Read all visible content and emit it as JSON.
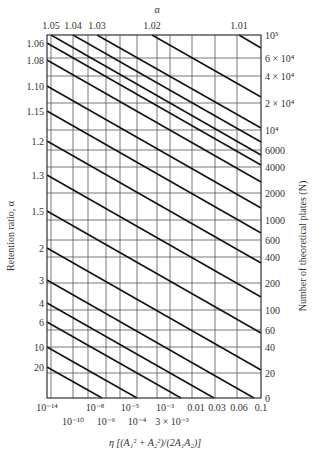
{
  "chart_data": {
    "type": "line",
    "title": "",
    "xlabel": "η [(A₁² + A₂²)/(2A₁A₂)]",
    "ylabel_left": "Retention ratio, α",
    "ylabel_right": "Number of theoretical plates (N)",
    "top_axis_label": "α",
    "top_ticks": [
      {
        "label": "1.05",
        "x": 51
      },
      {
        "label": "1.04",
        "x": 73
      },
      {
        "label": "1.03",
        "x": 97
      },
      {
        "label": "1.02",
        "x": 152
      },
      {
        "label": "1.01",
        "x": 239
      }
    ],
    "left_ticks": [
      {
        "label": "1.06",
        "y": 43
      },
      {
        "label": "1.08",
        "y": 60
      },
      {
        "label": "1.10",
        "y": 86
      },
      {
        "label": "1.15",
        "y": 111
      },
      {
        "label": "1.2",
        "y": 141
      },
      {
        "label": "1.3",
        "y": 175
      },
      {
        "label": "1.5",
        "y": 211
      },
      {
        "label": "2",
        "y": 248
      },
      {
        "label": "3",
        "y": 280
      },
      {
        "label": "4",
        "y": 303
      },
      {
        "label": "6",
        "y": 322
      },
      {
        "label": "10",
        "y": 347
      },
      {
        "label": "20",
        "y": 367
      }
    ],
    "right_ticks": [
      {
        "label": "10⁵",
        "y": 35
      },
      {
        "label": "6 × 10⁴",
        "y": 58
      },
      {
        "label": "4 × 10⁴",
        "y": 76
      },
      {
        "label": "2 × 10⁴",
        "y": 103
      },
      {
        "label": "10⁴",
        "y": 130
      },
      {
        "label": "6000",
        "y": 150
      },
      {
        "label": "4000",
        "y": 167
      },
      {
        "label": "2000",
        "y": 193
      },
      {
        "label": "1000",
        "y": 220
      },
      {
        "label": "600",
        "y": 240
      },
      {
        "label": "400",
        "y": 257
      },
      {
        "label": "200",
        "y": 283
      },
      {
        "label": "100",
        "y": 310
      },
      {
        "label": "60",
        "y": 330
      },
      {
        "label": "40",
        "y": 347
      },
      {
        "label": "20",
        "y": 373
      },
      {
        "label": "0",
        "y": 398
      }
    ],
    "bottom_ticks_row1": [
      {
        "label": "10⁻¹⁴",
        "x": 47
      },
      {
        "label": "10⁻⁸",
        "x": 95
      },
      {
        "label": "10⁻⁵",
        "x": 130
      },
      {
        "label": "10⁻³",
        "x": 165
      },
      {
        "label": "0.01",
        "x": 196
      },
      {
        "label": "0.03",
        "x": 217
      },
      {
        "label": "0.06",
        "x": 239
      },
      {
        "label": "0.1",
        "x": 261
      }
    ],
    "bottom_ticks_row2": [
      {
        "label": "10⁻¹⁰",
        "x": 73
      },
      {
        "label": "10⁻⁶",
        "x": 106
      },
      {
        "label": "10⁻⁴",
        "x": 137
      },
      {
        "label": "3 × 10⁻³",
        "x": 172
      }
    ],
    "plot_area": {
      "x0": 47,
      "y0": 35,
      "x1": 261,
      "y1": 398
    },
    "vertical_gridlines_x": [
      51,
      73,
      88,
      106,
      120,
      137,
      157,
      170,
      192,
      215,
      237
    ],
    "horizontal_gridlines_y": [
      58,
      76,
      103,
      130,
      150,
      167,
      193,
      220,
      240,
      257,
      283,
      310,
      330,
      347,
      373
    ],
    "series": [
      {
        "name": "alpha 1.06 line",
        "x0": 47,
        "y0": 43,
        "x1": 261,
        "y1": 165
      },
      {
        "name": "alpha 1.08 line",
        "x0": 47,
        "y0": 60,
        "x1": 261,
        "y1": 182
      },
      {
        "name": "alpha 1.10 line",
        "x0": 47,
        "y0": 86,
        "x1": 261,
        "y1": 208
      },
      {
        "name": "alpha 1.15 line",
        "x0": 47,
        "y0": 111,
        "x1": 261,
        "y1": 233
      },
      {
        "name": "alpha 1.2 line",
        "x0": 47,
        "y0": 141,
        "x1": 261,
        "y1": 263
      },
      {
        "name": "alpha 1.3 line",
        "x0": 47,
        "y0": 175,
        "x1": 261,
        "y1": 297
      },
      {
        "name": "alpha 1.5 line",
        "x0": 47,
        "y0": 211,
        "x1": 261,
        "y1": 333
      },
      {
        "name": "alpha 2 line",
        "x0": 47,
        "y0": 248,
        "x1": 261,
        "y1": 370
      },
      {
        "name": "alpha 3 line",
        "x0": 47,
        "y0": 280,
        "x1": 254,
        "y1": 398
      },
      {
        "name": "alpha 4 line",
        "x0": 47,
        "y0": 303,
        "x1": 214,
        "y1": 398
      },
      {
        "name": "alpha 6 line",
        "x0": 47,
        "y0": 322,
        "x1": 181,
        "y1": 398
      },
      {
        "name": "alpha 10 line",
        "x0": 47,
        "y0": 347,
        "x1": 137,
        "y1": 398
      },
      {
        "name": "alpha 20 line",
        "x0": 47,
        "y0": 367,
        "x1": 102,
        "y1": 398
      },
      {
        "name": "alpha 1.05 line",
        "x0": 51,
        "y0": 35,
        "x1": 261,
        "y1": 155
      },
      {
        "name": "alpha 1.04 line",
        "x0": 73,
        "y0": 35,
        "x1": 261,
        "y1": 142
      },
      {
        "name": "alpha 1.03 line",
        "x0": 97,
        "y0": 35,
        "x1": 261,
        "y1": 128
      },
      {
        "name": "alpha 1.02 line",
        "x0": 152,
        "y0": 35,
        "x1": 261,
        "y1": 97
      },
      {
        "name": "alpha 1.01 line",
        "x0": 239,
        "y0": 35,
        "x1": 261,
        "y1": 48
      }
    ]
  }
}
